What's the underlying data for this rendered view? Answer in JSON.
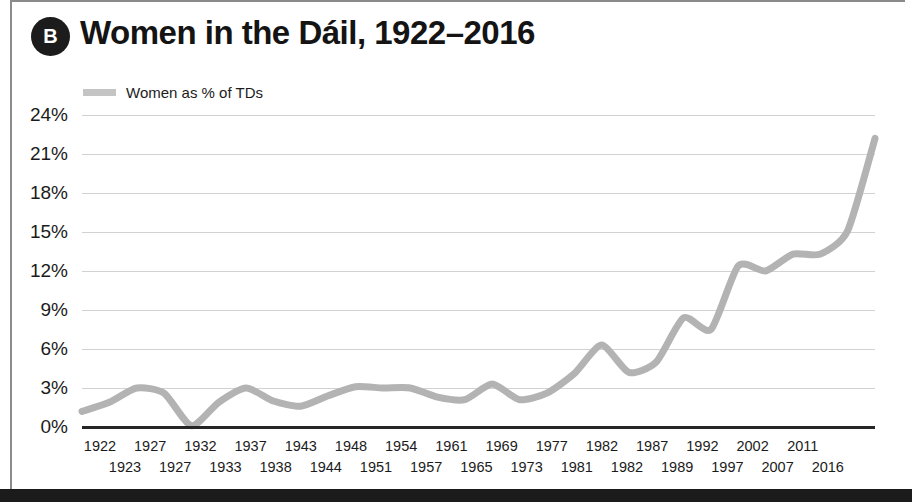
{
  "figure": {
    "badge_label": "B",
    "title": "Women in the Dáil, 1922–2016",
    "frame_color": "#8c8c8c",
    "bottom_bar_color": "#1b1b1b"
  },
  "legend": {
    "position": "top-left",
    "entries": [
      {
        "label": "Women as % of TDs",
        "color": "#c4c4c4"
      }
    ]
  },
  "chart_data": {
    "type": "line",
    "title": "Women in the Dáil, 1922–2016",
    "xlabel": "",
    "ylabel": "",
    "ylim": [
      0,
      24
    ],
    "ytick_step": 3,
    "ytick_labels": [
      "24%",
      "21%",
      "18%",
      "15%",
      "12%",
      "9%",
      "6%",
      "3%",
      "0%"
    ],
    "ytick_values": [
      24,
      21,
      18,
      15,
      12,
      9,
      6,
      3,
      0
    ],
    "grid": true,
    "legend_position": "top-left",
    "line_color": "#b3b3b3",
    "line_width": 7,
    "xtick_labels_top": [
      "1922",
      "1927",
      "1932",
      "1937",
      "1943",
      "1948",
      "1954",
      "1961",
      "1969",
      "1977",
      "1982",
      "1987",
      "1992",
      "2002",
      "2011"
    ],
    "xtick_labels_bottom": [
      "1923",
      "1927",
      "1933",
      "1938",
      "1944",
      "1951",
      "1957",
      "1965",
      "1973",
      "1981",
      "1982",
      "1989",
      "1997",
      "2007",
      "2016"
    ],
    "series": [
      {
        "name": "Women as % of TDs",
        "x": [
          1922,
          1923,
          1927,
          1927,
          1932,
          1933,
          1937,
          1938,
          1943,
          1944,
          1948,
          1951,
          1954,
          1957,
          1961,
          1965,
          1969,
          1973,
          1977,
          1981,
          1982,
          1982,
          1987,
          1989,
          1992,
          1997,
          2002,
          2007,
          2011,
          2016
        ],
        "values": [
          1.2,
          1.9,
          3.0,
          2.6,
          0.1,
          1.9,
          3.0,
          2.0,
          1.6,
          2.4,
          3.1,
          3.0,
          3.0,
          2.3,
          2.1,
          3.3,
          2.1,
          2.6,
          4.1,
          6.3,
          4.2,
          5.0,
          8.4,
          7.5,
          12.4,
          12.0,
          13.3,
          13.3,
          15.1,
          22.2
        ]
      }
    ]
  }
}
